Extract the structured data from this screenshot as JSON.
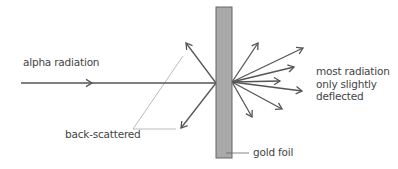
{
  "labels": {
    "incoming": "alpha radiation",
    "back_scattered": "back-scattered",
    "gold_foil": "gold foil",
    "forward": [
      "most radiation",
      "only slightly",
      "deflected"
    ]
  },
  "colors": {
    "arrow": "#555555",
    "foil_fill": "#a9a9a9",
    "foil_stroke": "#666666",
    "leader": "#aaaaaa",
    "text": "#444444"
  },
  "geometry": {
    "foil": {
      "x": 216,
      "y": 7,
      "w": 16,
      "h": 151
    },
    "incoming": {
      "x1": 21,
      "y1": 83,
      "x2": 216,
      "y2": 83,
      "head_x": 92
    },
    "impact_left": [
      216,
      83
    ],
    "impact_right": [
      232,
      82
    ],
    "back_arrows": [
      [
        186,
        43
      ],
      [
        181,
        128
      ]
    ],
    "forward_arrows": [
      [
        258,
        43
      ],
      [
        303,
        48
      ],
      [
        294,
        67
      ],
      [
        280,
        81
      ],
      [
        302,
        91
      ],
      [
        282,
        109
      ],
      [
        252,
        117
      ]
    ]
  }
}
